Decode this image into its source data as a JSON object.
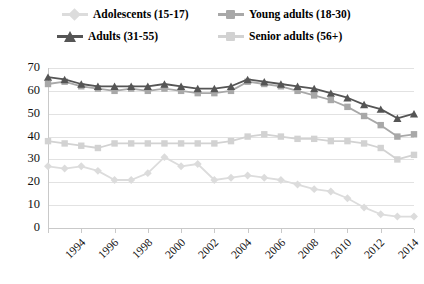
{
  "legend": {
    "position": "top",
    "items": [
      {
        "label": "Adolescents (15-17)",
        "color": "#dcdcdc",
        "marker": "diamond",
        "name": "legend-adolescents"
      },
      {
        "label": "Young adults (18-30)",
        "color": "#a8a8a8",
        "marker": "square",
        "name": "legend-young-adults"
      },
      {
        "label": "Adults (31-55)",
        "color": "#555555",
        "marker": "triangle",
        "name": "legend-adults"
      },
      {
        "label": "Senior adults (56+)",
        "color": "#d2d2d2",
        "marker": "square",
        "name": "legend-senior-adults"
      }
    ]
  },
  "chart_data": {
    "type": "line",
    "title": "",
    "xlabel": "",
    "ylabel": "",
    "ylim": [
      0,
      70
    ],
    "ytick_step": 10,
    "yticks": [
      0,
      10,
      20,
      30,
      40,
      50,
      60,
      70
    ],
    "grid": true,
    "x": [
      1994,
      1995,
      1996,
      1997,
      1998,
      1999,
      2000,
      2001,
      2002,
      2003,
      2004,
      2005,
      2006,
      2007,
      2008,
      2009,
      2010,
      2011,
      2012,
      2013,
      2014,
      2015,
      2016
    ],
    "xtick_labels": [
      "1994",
      "1996",
      "1998",
      "2000",
      "2002",
      "2004",
      "2006",
      "2008",
      "2010",
      "2012",
      "2014",
      "2016"
    ],
    "xtick_values": [
      1994,
      1996,
      1998,
      2000,
      2002,
      2004,
      2006,
      2008,
      2010,
      2012,
      2014,
      2016
    ],
    "series": [
      {
        "name": "Adolescents (15-17)",
        "color": "#dcdcdc",
        "marker": "diamond",
        "values": [
          27,
          26,
          27,
          25,
          21,
          21,
          24,
          31,
          27,
          28,
          21,
          22,
          23,
          22,
          21,
          19,
          17,
          16,
          13,
          9,
          6,
          5,
          5
        ]
      },
      {
        "name": "Young adults (18-30)",
        "color": "#a8a8a8",
        "marker": "square",
        "values": [
          63,
          64,
          62,
          61,
          60,
          61,
          60,
          61,
          60,
          59,
          59,
          60,
          64,
          63,
          62,
          60,
          58,
          56,
          53,
          49,
          45,
          40,
          41
        ]
      },
      {
        "name": "Adults (31-55)",
        "color": "#555555",
        "marker": "triangle",
        "values": [
          66,
          65,
          63,
          62,
          62,
          62,
          62,
          63,
          62,
          61,
          61,
          62,
          65,
          64,
          63,
          62,
          61,
          59,
          57,
          54,
          52,
          48,
          50
        ]
      },
      {
        "name": "Senior adults (56+)",
        "color": "#d2d2d2",
        "marker": "square",
        "values": [
          38,
          37,
          36,
          35,
          37,
          37,
          37,
          37,
          37,
          37,
          37,
          38,
          40,
          41,
          40,
          39,
          39,
          38,
          38,
          37,
          35,
          30,
          32
        ]
      }
    ]
  }
}
